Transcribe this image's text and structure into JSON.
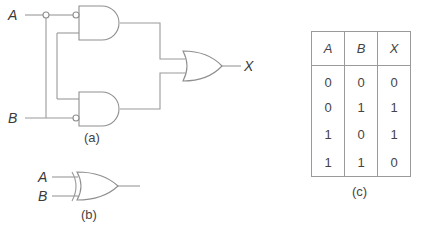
{
  "part_a": {
    "caption": "(a)",
    "inputs": {
      "a": "A",
      "b": "B"
    },
    "output": "X",
    "gates": [
      "AND (inverted A input)",
      "AND (inverted B input)",
      "OR"
    ]
  },
  "part_b": {
    "caption": "(b)",
    "inputs": {
      "a": "A",
      "b": "B"
    },
    "gate": "XOR"
  },
  "part_c": {
    "caption": "(c)",
    "truth_table": {
      "headers": [
        "A",
        "B",
        "X"
      ],
      "rows": [
        [
          "0",
          "0",
          "0"
        ],
        [
          "0",
          "1",
          "1"
        ],
        [
          "1",
          "0",
          "1"
        ],
        [
          "1",
          "1",
          "0"
        ]
      ]
    }
  }
}
